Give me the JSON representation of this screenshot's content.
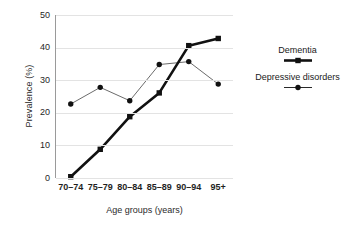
{
  "chart_data": {
    "type": "line",
    "title": "",
    "xlabel": "Age groups (years)",
    "ylabel": "Prevalence (%)",
    "categories": [
      "70–74",
      "75–79",
      "80–84",
      "85–89",
      "90–94",
      "95+"
    ],
    "ylim": [
      0,
      50
    ],
    "yticks": [
      0,
      10,
      20,
      30,
      40,
      50
    ],
    "ytick_labels": [
      "0",
      "10",
      "20",
      "30",
      "40",
      "50"
    ],
    "grid": true,
    "grid_axis": "y",
    "legend_position": "right",
    "series": [
      {
        "name": "Dementia",
        "values": [
          0.4,
          8.8,
          18.8,
          26.1,
          40.6,
          42.8
        ],
        "marker": "square",
        "line_width": "thick",
        "color": "#111111"
      },
      {
        "name": "Depressive disorders",
        "values": [
          22.7,
          27.8,
          23.7,
          34.8,
          35.7,
          28.8
        ],
        "marker": "circle",
        "line_width": "thin",
        "color": "#5a5a5a"
      }
    ]
  },
  "axes": {
    "y_title": "Prevalence (%)",
    "x_title": "Age groups (years)",
    "y_tick_labels": [
      "50",
      "40",
      "30",
      "20",
      "10",
      "0"
    ],
    "x_tick_labels": [
      "70–74",
      "75–79",
      "80–84",
      "85–89",
      "90–94",
      "95+"
    ]
  },
  "legend": {
    "entries": [
      {
        "label": "Dementia",
        "marker": "square",
        "style": "thick-line"
      },
      {
        "label": "Depressive disorders",
        "marker": "circle",
        "style": "thin-line"
      }
    ]
  },
  "colors": {
    "dementia": "#111111",
    "depressive": "#5a5a5a",
    "gridline": "#e3e3e3",
    "axis": "#9a9a9a",
    "background": "#ffffff",
    "text": "#1a1a1a"
  }
}
